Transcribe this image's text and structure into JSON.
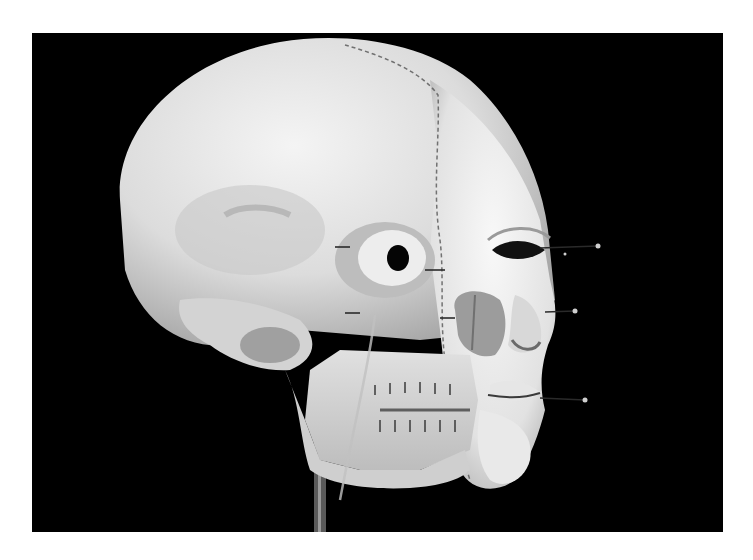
{
  "image": {
    "subject": "skull model with partial facial reconstruction",
    "style": "black-and-white photograph",
    "colors": {
      "background": "#000000",
      "border": "#ffffff",
      "skull": "#e8e8e8",
      "skull_shadow": "#9a9a9a",
      "tissue": "#f2f2f2",
      "markers": "#222222"
    }
  }
}
